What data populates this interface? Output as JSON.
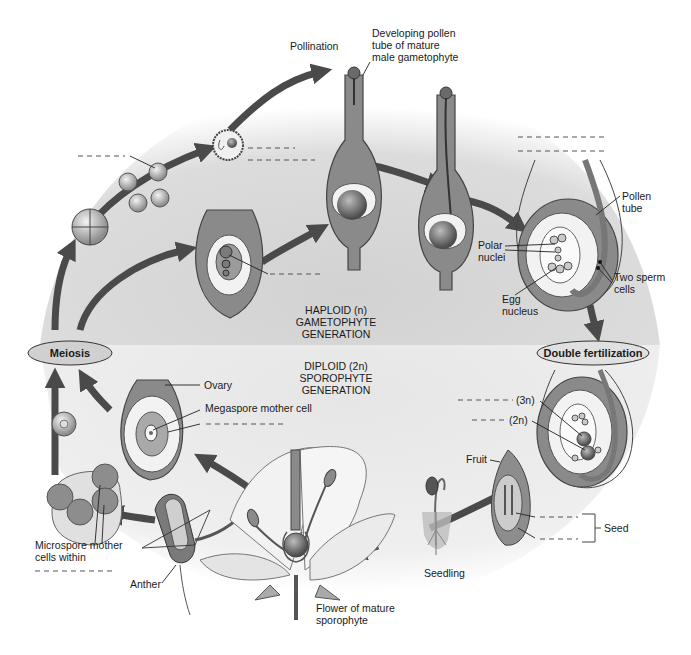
{
  "regions": {
    "haploid": {
      "line1": "HAPLOID (n)",
      "line2": "GAMETOPHYTE",
      "line3": "GENERATION"
    },
    "diploid": {
      "line1": "DIPLOID (2n)",
      "line2": "SPOROPHYTE",
      "line3": "GENERATION"
    }
  },
  "process_ovals": {
    "meiosis": "Meiosis",
    "double_fertilization": "Double fertilization"
  },
  "labels": {
    "pollination": "Pollination",
    "pollen_tube_1": "Developing pollen",
    "pollen_tube_2": "tube of mature",
    "pollen_tube_3": "male gametophyte",
    "pollen_tube_right_1": "Pollen",
    "pollen_tube_right_2": "tube",
    "polar_nuclei_1": "Polar",
    "polar_nuclei_2": "nuclei",
    "two_sperm_1": "Two sperm",
    "two_sperm_2": "cells",
    "egg_nucleus_1": "Egg",
    "egg_nucleus_2": "nucleus",
    "ovary": "Ovary",
    "megaspore_mother_cell": "Megaspore mother cell",
    "triploid": "(3n)",
    "diploid_2n": "(2n)",
    "fruit": "Fruit",
    "seed": "Seed",
    "seedling": "Seedling",
    "flower_1": "Flower of mature",
    "flower_2": "sporophyte",
    "anther": "Anther",
    "microspore_1": "Microspore mother",
    "microspore_2": "cells within"
  },
  "blank_label_count": 12,
  "colors": {
    "haploid_bg": "#d6d6d6",
    "diploid_bg": "#ececec",
    "arrow": "#4a4a4a",
    "oval_fill": "#d0d0d0"
  }
}
